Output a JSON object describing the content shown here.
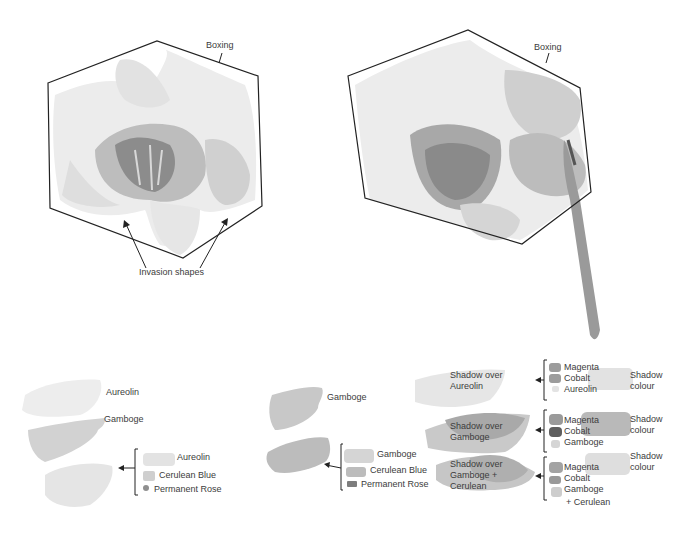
{
  "illustration_left": {
    "boxing_label": "Boxing",
    "invasion_label": "Invasion shapes"
  },
  "illustration_right": {
    "boxing_label": "Boxing"
  },
  "swatches_left": {
    "aureolin": "Aureolin",
    "gamboge": "Gamboge",
    "mix": [
      "Aureolin",
      "Cerulean Blue",
      "Permanent Rose"
    ]
  },
  "swatches_middle": {
    "gamboge": "Gamboge",
    "mix": [
      "Gamboge",
      "Cerulean Blue",
      "Permanent Rose"
    ]
  },
  "shadow_rows": [
    {
      "label_line1": "Shadow over",
      "label_line2": "Aureolin",
      "label_line3": "",
      "mix": [
        "Magenta",
        "Cobalt",
        "Aureolin"
      ],
      "extra": "",
      "result_line1": "Shadow",
      "result_line2": "colour"
    },
    {
      "label_line1": "Shadow over",
      "label_line2": "Gamboge",
      "label_line3": "",
      "mix": [
        "Magenta",
        "Cobalt",
        "Gamboge"
      ],
      "extra": "",
      "result_line1": "Shadow",
      "result_line2": "colour"
    },
    {
      "label_line1": "Shadow over",
      "label_line2": "Gamboge +",
      "label_line3": "Cerulean",
      "mix": [
        "Magenta",
        "Cobalt",
        "Gamboge"
      ],
      "extra": "+ Cerulean",
      "result_line1": "Shadow",
      "result_line2": "colour"
    }
  ]
}
